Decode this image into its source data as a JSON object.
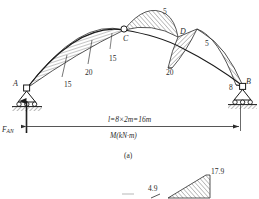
{
  "figure": {
    "caption": "(a)",
    "diagram_type": "bending-moment-diagram",
    "quantity_label": "M(kN·m)",
    "span_label": "l=8×2m=16m",
    "reaction_label": "F",
    "reaction_sub": "AN",
    "nodes": [
      {
        "id": "A",
        "label": "A",
        "support": "pin-roller",
        "x": 27,
        "y": 88
      },
      {
        "id": "C",
        "label": "C",
        "support": "hinge",
        "x": 124,
        "y": 30
      },
      {
        "id": "D",
        "label": "D",
        "support": "none",
        "x": 178,
        "y": 37
      },
      {
        "id": "B",
        "label": "B",
        "support": "pin-roller",
        "x": 243,
        "y": 86
      }
    ],
    "moment_values": [
      {
        "label": "15",
        "x": 68,
        "y": 84,
        "name": "moment-value-left-15"
      },
      {
        "label": "20",
        "x": 88,
        "y": 72,
        "name": "moment-value-left-20"
      },
      {
        "label": "15",
        "x": 110,
        "y": 57,
        "name": "moment-value-c-left-15"
      },
      {
        "label": "5",
        "x": 163,
        "y": 12,
        "name": "moment-value-cd-5"
      },
      {
        "label": "20",
        "x": 170,
        "y": 70,
        "name": "moment-value-d-20"
      },
      {
        "label": "5",
        "x": 207,
        "y": 44,
        "name": "moment-value-db-5"
      },
      {
        "label": "8",
        "x": 230,
        "y": 86,
        "name": "moment-value-b-8"
      }
    ],
    "lower_figure": {
      "values": [
        {
          "label": "4.9",
          "x": 156,
          "y": 188,
          "name": "lower-value-4-9"
        },
        {
          "label": "17.9",
          "x": 212,
          "y": 176,
          "name": "lower-value-17-9"
        }
      ]
    }
  },
  "colors": {
    "ink": "#2b2b2b",
    "hatch": "#3a3a3a",
    "paper": "#ffffff"
  }
}
